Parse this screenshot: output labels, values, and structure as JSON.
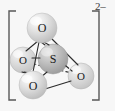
{
  "figure": {
    "formula": "SO4",
    "charge_label": "2–",
    "bracket": {
      "left_symbol": "[",
      "right_symbol": "]",
      "color": "#585858"
    },
    "background_color": "#f7f7f7",
    "geometry_name": "tetrahedral",
    "atoms": [
      {
        "id": "o-top",
        "element": "O",
        "label": "O",
        "cx": 42,
        "cy": 28,
        "r": 15,
        "fill": "#d4d4d4",
        "highlight": "#f2f2f2",
        "position_name": "top-oxygen"
      },
      {
        "id": "o-left",
        "element": "O",
        "label": "O",
        "cx": 23,
        "cy": 60,
        "r": 13,
        "fill": "#d0d0d0",
        "highlight": "#eeeeee",
        "position_name": "left-oxygen"
      },
      {
        "id": "s-center",
        "element": "S",
        "label": "S",
        "cx": 53,
        "cy": 59,
        "r": 15,
        "fill": "#b4b4b4",
        "highlight": "#d8d8d8",
        "position_name": "central-sulfur"
      },
      {
        "id": "o-bottom",
        "element": "O",
        "label": "O",
        "cx": 33,
        "cy": 85,
        "r": 14,
        "fill": "#d2d2d2",
        "highlight": "#f0f0f0",
        "position_name": "bottom-oxygen"
      },
      {
        "id": "o-right",
        "element": "O",
        "label": "O",
        "cx": 81,
        "cy": 76,
        "r": 13,
        "fill": "#d0d0d0",
        "highlight": "#eeeeee",
        "position_name": "right-oxygen"
      }
    ],
    "bonds": [
      {
        "id": "b-s-otop",
        "from": "s-center",
        "to": "o-top",
        "style": "solid",
        "name": "bond-s-to-top-oxygen"
      },
      {
        "id": "b-s-oleft",
        "from": "s-center",
        "to": "o-left",
        "style": "solid",
        "name": "bond-s-to-left-oxygen"
      },
      {
        "id": "b-s-obottom",
        "from": "s-center",
        "to": "o-bottom",
        "style": "solid",
        "name": "bond-s-to-bottom-oxygen"
      },
      {
        "id": "b-s-oright",
        "from": "s-center",
        "to": "o-right",
        "style": "dashed",
        "name": "bond-s-to-right-oxygen"
      }
    ],
    "edges": [
      {
        "id": "e-top-left",
        "from": "o-top",
        "to": "o-left",
        "style": "solid",
        "name": "edge-top-to-left"
      },
      {
        "id": "e-top-bottom",
        "from": "o-top",
        "to": "o-bottom",
        "style": "solid",
        "name": "edge-top-to-bottom"
      },
      {
        "id": "e-top-right",
        "from": "o-top",
        "to": "o-right",
        "style": "solid",
        "name": "edge-top-to-right"
      },
      {
        "id": "e-left-bottom",
        "from": "o-left",
        "to": "o-bottom",
        "style": "solid",
        "name": "edge-left-to-bottom"
      },
      {
        "id": "e-bottom-right",
        "from": "o-bottom",
        "to": "o-right",
        "style": "solid",
        "name": "edge-bottom-to-right"
      },
      {
        "id": "e-left-right",
        "from": "o-left",
        "to": "o-right",
        "style": "dashed",
        "name": "edge-left-to-right"
      }
    ],
    "line_color": "#2b2b2b"
  }
}
